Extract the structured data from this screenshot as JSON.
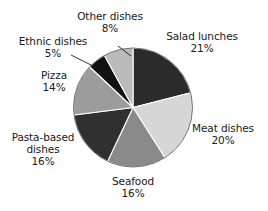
{
  "chart_data": {
    "type": "pie",
    "title": "",
    "subtitle": "",
    "xlabel": "",
    "ylabel": "",
    "legend_position": "none",
    "grid": false,
    "start_angle_deg": 0,
    "direction": "clockwise",
    "categories": [
      "Salad lunches",
      "Meat dishes",
      "Seafood",
      "Pasta-based dishes",
      "Pizza",
      "Ethnic dishes",
      "Other dishes"
    ],
    "values": [
      21,
      20,
      16,
      16,
      14,
      5,
      8
    ],
    "value_suffix": "%",
    "slices": [
      {
        "label": "Salad lunches",
        "label_lines": [
          "Salad lunches"
        ],
        "value": 21,
        "value_text": "21%",
        "color": "#2b2b2b"
      },
      {
        "label": "Meat dishes",
        "label_lines": [
          "Meat dishes"
        ],
        "value": 20,
        "value_text": "20%",
        "color": "#d6d6d6"
      },
      {
        "label": "Seafood",
        "label_lines": [
          "Seafood"
        ],
        "value": 16,
        "value_text": "16%",
        "color": "#8a8a8a"
      },
      {
        "label": "Pasta-based dishes",
        "label_lines": [
          "Pasta-based",
          "dishes"
        ],
        "value": 16,
        "value_text": "16%",
        "color": "#303030"
      },
      {
        "label": "Pizza",
        "label_lines": [
          "Pizza"
        ],
        "value": 14,
        "value_text": "14%",
        "color": "#9c9c9c"
      },
      {
        "label": "Ethnic dishes",
        "label_lines": [
          "Ethnic dishes"
        ],
        "value": 5,
        "value_text": "5%",
        "color": "#111111"
      },
      {
        "label": "Other dishes",
        "label_lines": [
          "Other dishes"
        ],
        "value": 8,
        "value_text": "8%",
        "color": "#bababa"
      }
    ]
  },
  "labels": {
    "other_dishes": {
      "name": "Other dishes",
      "value": "8%"
    },
    "salad_lunches": {
      "name": "Salad lunches",
      "value": "21%"
    },
    "ethnic_dishes": {
      "name": "Ethnic dishes",
      "value": "5%"
    },
    "pizza": {
      "name": "Pizza",
      "value": "14%"
    },
    "meat_dishes": {
      "name": "Meat dishes",
      "value": "20%"
    },
    "pasta_based": {
      "name_line1": "Pasta-based",
      "name_line2": "dishes",
      "value": "16%"
    },
    "seafood": {
      "name": "Seafood",
      "value": "16%"
    }
  },
  "style": {
    "background": "#ffffff",
    "text_color": "#1a1a1a",
    "slice_outline": "#ffffff"
  }
}
